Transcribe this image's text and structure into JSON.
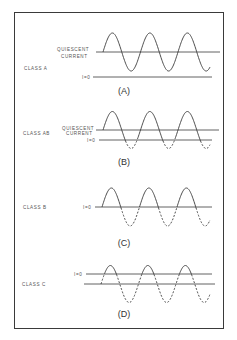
{
  "diagram": {
    "colors": {
      "ink": "#3a3a3a",
      "frame": "#3a3a3a",
      "background": "#ffffff"
    },
    "panels": [
      {
        "id": "A",
        "class_label": "CLASS A",
        "caption": "(A)",
        "line_labels": [
          "QUIESCENT",
          "CURRENT",
          "I=0"
        ],
        "description": "Full sine wave entirely above I=0; current flows for full 360°."
      },
      {
        "id": "AB",
        "class_label": "CLASS AB",
        "caption": "(B)",
        "line_labels": [
          "QUIESCENT",
          "CURRENT",
          "I=0"
        ],
        "description": "Sine centered on quiescent current; portions below I=0 shown dashed (cut off)."
      },
      {
        "id": "B",
        "class_label": "CLASS B",
        "caption": "(C)",
        "line_labels": [
          "I=0"
        ],
        "description": "Sine centered on I=0; negative half-cycles dashed (180° conduction)."
      },
      {
        "id": "C",
        "class_label": "CLASS C",
        "caption": "(D)",
        "line_labels": [
          "I=0"
        ],
        "description": "Sine centered below I=0 (bias line); only peaks above I=0 solid (<180° conduction)."
      }
    ]
  }
}
